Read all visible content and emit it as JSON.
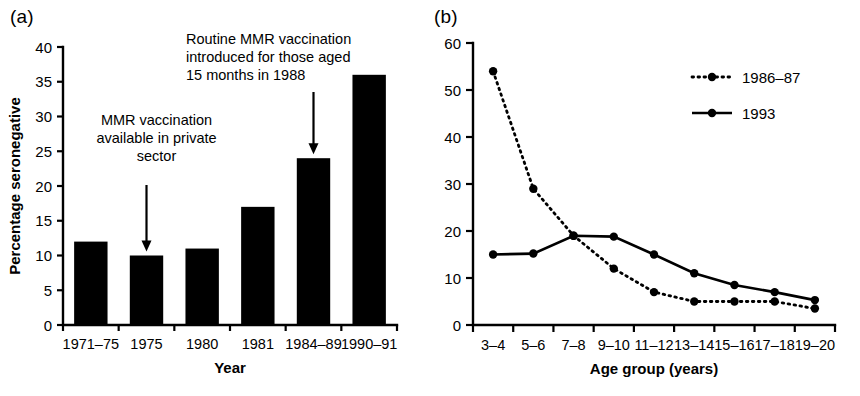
{
  "figure": {
    "background": "#ffffff",
    "ink_color": "#000000"
  },
  "panels": {
    "a": {
      "label": "(a)",
      "xlabel": "Year",
      "ylabel": "Percentage seronegative",
      "annotations": [
        {
          "name": "private-sector-annotation",
          "lines": [
            "MMR vaccination",
            "available in private",
            "sector"
          ],
          "align": "middle",
          "target_category": "1975"
        },
        {
          "name": "routine-vaccination-annotation",
          "lines": [
            "Routine MMR vaccination",
            "introduced for those aged",
            "15 months in 1988"
          ],
          "align": "start",
          "target_category": "1984–89"
        }
      ]
    },
    "b": {
      "label": "(b)",
      "xlabel": "Age group (years)",
      "ylabel": "",
      "legend": [
        {
          "name": "legend-1986-87",
          "label": "1986–87",
          "style": "dotted",
          "marker": "circle"
        },
        {
          "name": "legend-1993",
          "label": "1993",
          "style": "solid",
          "marker": "circle"
        }
      ]
    }
  },
  "chart_data": [
    {
      "type": "bar",
      "panel": "a",
      "title": "",
      "xlabel": "Year",
      "ylabel": "Percentage seronegative",
      "categories": [
        "1971–75",
        "1975",
        "1980",
        "1981",
        "1984–89",
        "1990–91"
      ],
      "values": [
        12,
        10,
        11,
        17,
        24,
        36
      ],
      "ylim": [
        0,
        40
      ],
      "yticks": [
        0,
        5,
        10,
        15,
        20,
        25,
        30,
        35,
        40
      ],
      "ytick_labels": [
        "0",
        "5",
        "10",
        "15",
        "20",
        "25",
        "30",
        "35",
        "40"
      ],
      "grid": false,
      "legend": "none"
    },
    {
      "type": "line",
      "panel": "b",
      "title": "",
      "xlabel": "Age group (years)",
      "ylabel": "",
      "categories": [
        "3–4",
        "5–6",
        "7–8",
        "9–10",
        "11–12",
        "13–14",
        "15–16",
        "17–18",
        "19–20"
      ],
      "ylim": [
        0,
        60
      ],
      "yticks": [
        0,
        10,
        20,
        30,
        40,
        50,
        60
      ],
      "ytick_labels": [
        "0",
        "10",
        "20",
        "30",
        "40",
        "50",
        "60"
      ],
      "grid": false,
      "legend": "upper right",
      "series": [
        {
          "name": "1986–87",
          "style": "dotted",
          "values": [
            54,
            29,
            19,
            12,
            7,
            5,
            5,
            5,
            3.5
          ]
        },
        {
          "name": "1993",
          "style": "solid",
          "values": [
            15,
            15.2,
            19,
            18.8,
            15,
            11,
            8.5,
            7,
            5.3
          ]
        }
      ]
    }
  ]
}
